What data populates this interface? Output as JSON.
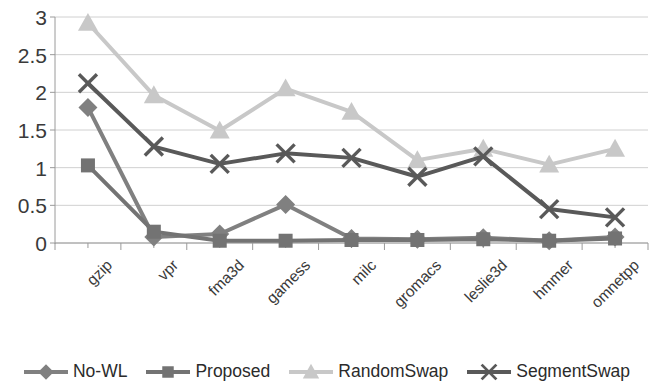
{
  "chart_data": {
    "type": "line",
    "title": "",
    "xlabel": "",
    "ylabel": "",
    "grid": true,
    "legend_position": "bottom",
    "ylim": [
      0,
      3
    ],
    "yticks": [
      "0",
      "0.5",
      "1",
      "1.5",
      "2",
      "2.5",
      "3"
    ],
    "ytick_values": [
      0,
      0.5,
      1,
      1.5,
      2,
      2.5,
      3
    ],
    "categories": [
      "gzip",
      "vpr",
      "fma3d",
      "gamess",
      "milc",
      "gromacs",
      "leslie3d",
      "hmmer",
      "omnetpp"
    ],
    "series": [
      {
        "name": "No-WL",
        "marker": "diamond",
        "color": "#808080",
        "values": [
          1.8,
          0.08,
          0.12,
          0.51,
          0.06,
          0.05,
          0.07,
          0.03,
          0.08
        ]
      },
      {
        "name": "Proposed",
        "marker": "square",
        "color": "#737373",
        "values": [
          1.03,
          0.15,
          0.03,
          0.03,
          0.04,
          0.04,
          0.05,
          0.03,
          0.06
        ]
      },
      {
        "name": "RandomSwap",
        "marker": "triangle",
        "color": "#c8c8c8",
        "values": [
          2.92,
          1.96,
          1.49,
          2.05,
          1.74,
          1.1,
          1.25,
          1.04,
          1.25
        ]
      },
      {
        "name": "SegmentSwap",
        "marker": "cross",
        "color": "#595959",
        "values": [
          2.12,
          1.28,
          1.05,
          1.19,
          1.13,
          0.88,
          1.15,
          0.45,
          0.34
        ]
      }
    ]
  },
  "axis": {
    "tick_color": "#9a9a9a",
    "grid_color": "#d0d0d0"
  }
}
